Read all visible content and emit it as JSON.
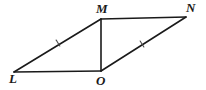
{
  "figure": {
    "background_color": "#ffffff",
    "stroke_color": "#1a1a1a",
    "tick_color": "#4a4a4a",
    "label_color": "#1a1a1a",
    "width": 206,
    "height": 90,
    "vertices": [
      {
        "name": "L",
        "label": "L",
        "x": 14,
        "y": 72,
        "label_x": 9,
        "label_y": 72
      },
      {
        "name": "M",
        "label": "M",
        "x": 101,
        "y": 19,
        "label_x": 96,
        "label_y": 2
      },
      {
        "name": "N",
        "label": "N",
        "x": 186,
        "y": 17,
        "label_x": 186,
        "label_y": 1
      },
      {
        "name": "O",
        "label": "O",
        "x": 101,
        "y": 71,
        "label_x": 96,
        "label_y": 74
      }
    ],
    "segments": [
      {
        "name": "segment-LM",
        "from": "L",
        "to": "M",
        "x1": 14,
        "y1": 72,
        "x2": 101,
        "y2": 19,
        "width": 1.6
      },
      {
        "name": "segment-MN",
        "from": "M",
        "to": "N",
        "x1": 101,
        "y1": 19,
        "x2": 186,
        "y2": 17,
        "width": 1.6
      },
      {
        "name": "segment-MO",
        "from": "M",
        "to": "O",
        "x1": 101,
        "y1": 19,
        "x2": 101,
        "y2": 71,
        "width": 1.6
      },
      {
        "name": "segment-ON",
        "from": "O",
        "to": "N",
        "x1": 101,
        "y1": 71,
        "x2": 186,
        "y2": 17,
        "width": 1.6
      },
      {
        "name": "segment-LO",
        "from": "L",
        "to": "O",
        "x1": 14,
        "y1": 72,
        "x2": 101,
        "y2": 71,
        "width": 1.6
      }
    ],
    "tick_marks": [
      {
        "name": "tick-on-LM",
        "on_segment": "segment-LM",
        "count": 1,
        "x": 58,
        "y": 43,
        "angle_deg": -31
      },
      {
        "name": "tick-on-ON",
        "on_segment": "segment-ON",
        "count": 1,
        "x": 142,
        "y": 44,
        "angle_deg": -32
      }
    ]
  }
}
